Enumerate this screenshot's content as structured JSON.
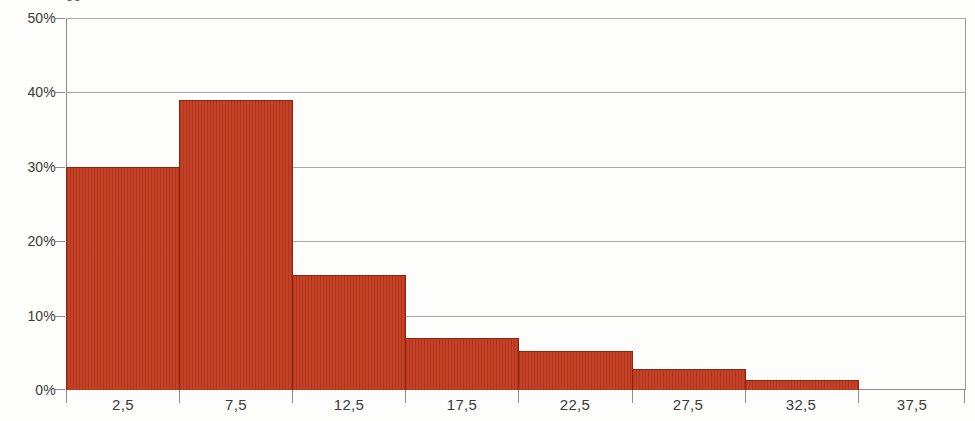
{
  "chart_data": {
    "type": "bar",
    "title": "",
    "title_clipped_text": "gg",
    "xlabel": "",
    "ylabel": "",
    "categories": [
      "2,5",
      "7,5",
      "12,5",
      "17,5",
      "22,5",
      "27,5",
      "32,5",
      "37,5"
    ],
    "values": [
      30.0,
      39.0,
      15.5,
      7.0,
      5.3,
      2.8,
      1.3,
      0.0
    ],
    "bin_edges": [
      0,
      5,
      10,
      15,
      20,
      25,
      30,
      35,
      40
    ],
    "ylim": [
      0,
      50
    ],
    "ytick_labels": [
      "0%",
      "10%",
      "20%",
      "30%",
      "40%",
      "50%"
    ],
    "ytick_values": [
      0,
      10,
      20,
      30,
      40,
      50
    ],
    "xtick_labels": [
      "2,5",
      "7,5",
      "12,5",
      "17,5",
      "22,5",
      "27,5",
      "32,5",
      "37,5"
    ],
    "grid": true,
    "legend": null,
    "bar_color": "#c0381c",
    "bar_border_color": "#8e2510",
    "grid_color": "#a8a8a8",
    "axis_color": "#8d8d8d",
    "background_color": "#fdfdfb",
    "text_color": "#3b3b3b"
  }
}
